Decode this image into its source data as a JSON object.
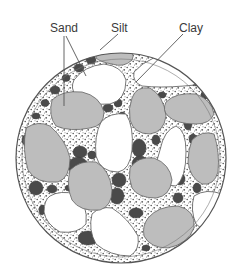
{
  "diagram": {
    "labels": {
      "sand": "Sand",
      "silt": "Silt",
      "clay": "Clay"
    },
    "colors": {
      "background": "#ffffff",
      "outline": "#555555",
      "sand_large": "#bdbdbd",
      "sand_white": "#ffffff",
      "silt": "#4a4a4a",
      "clay_speckle": "#6a6a6a",
      "leader_line": "#555555",
      "label_text": "#3a3a3a"
    }
  }
}
